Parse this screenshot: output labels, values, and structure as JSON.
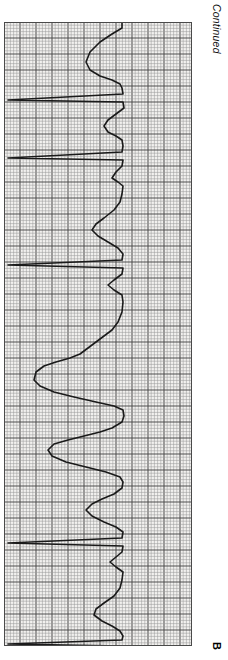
{
  "figure": {
    "panel_label": "B",
    "continuation_note": "Continued",
    "orientation_deg": 90,
    "background_color": "#ffffff"
  },
  "ecg": {
    "paper_color": "#f2f1ef",
    "fine_grid_color": "#9a9a9a",
    "bold_grid_color": "#4f4f4f",
    "trace_color": "#1a1a1a",
    "border_color": "#4a4a4a",
    "fine_grid_px": 3.2,
    "bold_every": 5,
    "strip_left_px": 4,
    "strip_top_px": 22,
    "strip_width_px": 188,
    "strip_height_px": 624,
    "baseline_x_px": 118,
    "trace_width_px": 1.6,
    "lead_label": "",
    "paper_speed": "25 mm/s",
    "gain": "10 mm/mV"
  },
  "chart_data": {
    "type": "line",
    "subtitle": "ECG tracing rotated 90 degrees; time axis runs top to bottom",
    "xlabel": "Amplitude (mV)",
    "ylabel": "Time (s)",
    "grid": true,
    "legend": null,
    "axis_orientation": "rotated-90",
    "ylim": [
      0,
      624
    ],
    "xlim": [
      0,
      188
    ],
    "series": [
      {
        "name": "ECG lead trace",
        "comment": "Point list in strip pixel coordinates: x = amplitude deflection (left = positive R wave), y = time progressing downward.",
        "points": [
          [
            118,
            0
          ],
          [
            118,
            6
          ],
          [
            108,
            12
          ],
          [
            96,
            20
          ],
          [
            86,
            30
          ],
          [
            82,
            40
          ],
          [
            86,
            48
          ],
          [
            96,
            54
          ],
          [
            108,
            58
          ],
          [
            116,
            62
          ],
          [
            118,
            66
          ],
          [
            119,
            72
          ],
          [
            4,
            78
          ],
          [
            119,
            80
          ],
          [
            120,
            86
          ],
          [
            112,
            92
          ],
          [
            104,
            98
          ],
          [
            100,
            104
          ],
          [
            104,
            110
          ],
          [
            112,
            114
          ],
          [
            118,
            118
          ],
          [
            119,
            124
          ],
          [
            118,
            130
          ],
          [
            4,
            136
          ],
          [
            119,
            138
          ],
          [
            118,
            144
          ],
          [
            112,
            150
          ],
          [
            108,
            156
          ],
          [
            114,
            160
          ],
          [
            119,
            164
          ],
          [
            118,
            172
          ],
          [
            116,
            180
          ],
          [
            110,
            188
          ],
          [
            100,
            196
          ],
          [
            92,
            202
          ],
          [
            88,
            208
          ],
          [
            94,
            214
          ],
          [
            104,
            220
          ],
          [
            114,
            226
          ],
          [
            119,
            232
          ],
          [
            118,
            238
          ],
          [
            4,
            243
          ],
          [
            119,
            246
          ],
          [
            118,
            252
          ],
          [
            110,
            258
          ],
          [
            104,
            263
          ],
          [
            110,
            268
          ],
          [
            118,
            273
          ],
          [
            119,
            280
          ],
          [
            118,
            290
          ],
          [
            114,
            300
          ],
          [
            108,
            308
          ],
          [
            100,
            314
          ],
          [
            92,
            320
          ],
          [
            84,
            326
          ],
          [
            76,
            332
          ],
          [
            66,
            336
          ],
          [
            52,
            340
          ],
          [
            40,
            344
          ],
          [
            32,
            350
          ],
          [
            30,
            358
          ],
          [
            36,
            364
          ],
          [
            50,
            370
          ],
          [
            70,
            375
          ],
          [
            92,
            380
          ],
          [
            110,
            384
          ],
          [
            119,
            388
          ],
          [
            120,
            394
          ],
          [
            118,
            400
          ],
          [
            108,
            406
          ],
          [
            96,
            410
          ],
          [
            80,
            414
          ],
          [
            64,
            418
          ],
          [
            50,
            422
          ],
          [
            44,
            428
          ],
          [
            48,
            434
          ],
          [
            62,
            440
          ],
          [
            82,
            445
          ],
          [
            102,
            450
          ],
          [
            116,
            455
          ],
          [
            119,
            460
          ],
          [
            118,
            466
          ],
          [
            110,
            472
          ],
          [
            98,
            477
          ],
          [
            88,
            482
          ],
          [
            82,
            488
          ],
          [
            88,
            494
          ],
          [
            100,
            500
          ],
          [
            112,
            505
          ],
          [
            119,
            510
          ],
          [
            118,
            516
          ],
          [
            4,
            521
          ],
          [
            119,
            524
          ],
          [
            118,
            530
          ],
          [
            112,
            535
          ],
          [
            106,
            540
          ],
          [
            112,
            545
          ],
          [
            119,
            550
          ],
          [
            118,
            558
          ],
          [
            116,
            566
          ],
          [
            110,
            574
          ],
          [
            100,
            581
          ],
          [
            92,
            587
          ],
          [
            90,
            593
          ],
          [
            98,
            599
          ],
          [
            108,
            604
          ],
          [
            116,
            609
          ],
          [
            119,
            614
          ],
          [
            118,
            618
          ],
          [
            4,
            622
          ],
          [
            119,
            624
          ]
        ]
      }
    ],
    "annotations": [
      {
        "text": "Continued",
        "position": "right-top",
        "italic": true
      },
      {
        "text": "B",
        "position": "right-bottom",
        "bold": true
      }
    ]
  }
}
